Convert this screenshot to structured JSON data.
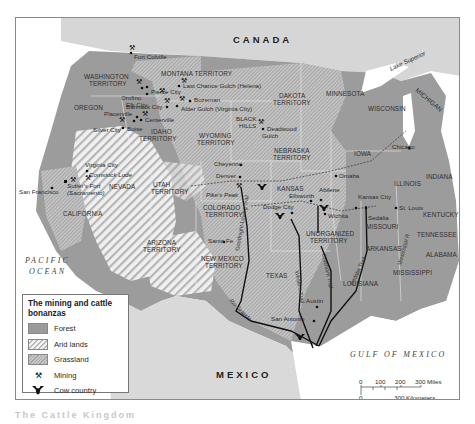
{
  "map": {
    "regions": {
      "country_north": "CANADA",
      "country_south": "MEXICO",
      "ocean_west": [
        "PACIFIC",
        "OCEAN"
      ],
      "gulf": "GULF OF MEXICO",
      "lake_superior": "Lake Superior",
      "lake_michigan": "Lake Michigan",
      "michigan": "MICHIGAN",
      "rio_grande": "Rio Grande",
      "mississippi": "Mississippi R."
    },
    "states": [
      {
        "id": "washington",
        "lines": [
          "WASHINGTON",
          "TERRITORY"
        ]
      },
      {
        "id": "montana",
        "lines": [
          "MONTANA TERRITORY"
        ]
      },
      {
        "id": "oregon",
        "lines": [
          "OREGON"
        ]
      },
      {
        "id": "idaho",
        "lines": [
          "IDAHO",
          "TERRITORY"
        ]
      },
      {
        "id": "wyoming",
        "lines": [
          "WYOMING",
          "TERRITORY"
        ]
      },
      {
        "id": "dakota",
        "lines": [
          "DAKOTA",
          "TERRITORY"
        ]
      },
      {
        "id": "black_hills",
        "lines": [
          "BLACK",
          "HILLS"
        ]
      },
      {
        "id": "minnesota",
        "lines": [
          "MINNESOTA"
        ]
      },
      {
        "id": "wisconsin",
        "lines": [
          "WISCONSIN"
        ]
      },
      {
        "id": "nebraska",
        "lines": [
          "NEBRASKA",
          "TERRITORY"
        ]
      },
      {
        "id": "iowa",
        "lines": [
          "IOWA"
        ]
      },
      {
        "id": "illinois",
        "lines": [
          "ILLINOIS"
        ]
      },
      {
        "id": "indiana",
        "lines": [
          "INDIANA"
        ]
      },
      {
        "id": "nevada",
        "lines": [
          "NEVADA"
        ]
      },
      {
        "id": "utah",
        "lines": [
          "UTAH",
          "TERRITORY"
        ]
      },
      {
        "id": "california",
        "lines": [
          "CALIFORNIA"
        ]
      },
      {
        "id": "colorado",
        "lines": [
          "COLORADO",
          "TERRITORY"
        ]
      },
      {
        "id": "kansas",
        "lines": [
          "KANSAS"
        ]
      },
      {
        "id": "missouri",
        "lines": [
          "MISSOURI"
        ]
      },
      {
        "id": "kentucky",
        "lines": [
          "KENTUCKY"
        ]
      },
      {
        "id": "tennessee",
        "lines": [
          "TENNESSEE"
        ]
      },
      {
        "id": "arizona",
        "lines": [
          "ARIZONA",
          "TERRITORY"
        ]
      },
      {
        "id": "new_mexico",
        "lines": [
          "NEW MEXICO",
          "TERRITORY"
        ]
      },
      {
        "id": "unorganized",
        "lines": [
          "UNORGANIZED",
          "TERRITORY"
        ]
      },
      {
        "id": "arkansas",
        "lines": [
          "ARKANSAS"
        ]
      },
      {
        "id": "texas",
        "lines": [
          "TEXAS"
        ]
      },
      {
        "id": "louisiana",
        "lines": [
          "LOUISIANA"
        ]
      },
      {
        "id": "mississippi",
        "lines": [
          "MISSISSIPPI"
        ]
      },
      {
        "id": "alabama",
        "lines": [
          "ALABAMA"
        ]
      }
    ],
    "places": [
      "Fort Colville",
      "Pierce City",
      "Orofino",
      "Elk City",
      "Last Chance Gulch (Helena)",
      "Bozeman",
      "Bannack City",
      "Alder Gulch (Virginia City)",
      "Placerville",
      "Centerville",
      "Boise",
      "Silver City",
      "Deadwood Gulch",
      "Virginia City",
      "Comstock Lode",
      "Sutter's Fort (Sacramento)",
      "San Francisco",
      "Cheyenne",
      "Denver",
      "Pike's Peak",
      "Omaha",
      "Chicago",
      "Ellsworth",
      "Abilene",
      "Kansas City",
      "Sedalia",
      "St. Louis",
      "Dodge City",
      "Wichita",
      "Santa Fe",
      "Austin",
      "San Antonio"
    ],
    "trails": [
      "Goodnight-Loving Trail",
      "Western Trail",
      "Chisholm Trail",
      "Sedalia Trail"
    ],
    "scale": {
      "miles_ticks": [
        "0",
        "100",
        "200",
        "300 Miles"
      ],
      "km_ticks": [
        "0",
        "300 Kilometers"
      ]
    }
  },
  "legend": {
    "title": "The mining and cattle bonanzas",
    "items": [
      {
        "type": "swatch",
        "style": "forest",
        "label": "Forest"
      },
      {
        "type": "swatch",
        "style": "arid",
        "label": "Arid lands"
      },
      {
        "type": "swatch",
        "style": "grass",
        "label": "Grassland"
      },
      {
        "type": "icon",
        "icon": "mining-icon",
        "label": "Mining"
      },
      {
        "type": "icon",
        "icon": "cow-country-icon",
        "label": "Cow country"
      }
    ]
  },
  "colors": {
    "forest": "#9a9a9a",
    "arid_light": "#f2f2f2",
    "grassland": "#bdbdbd",
    "water": "#ffffff",
    "foreign_land": "#d8d8d8",
    "trail": "#111111"
  },
  "caption": "The Cattle Kingdom"
}
